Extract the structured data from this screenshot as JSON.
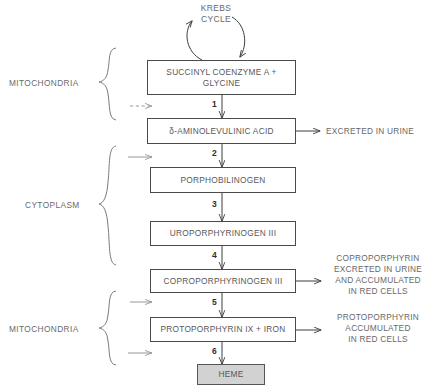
{
  "diagram": {
    "nodes": [
      {
        "id": "succinyl",
        "label": "SUCCINYL COENZYME A +\nGLYCINE"
      },
      {
        "id": "ala",
        "label": "δ-AMINOLEVULINIC ACID"
      },
      {
        "id": "pbg",
        "label": "PORPHOBILINOGEN"
      },
      {
        "id": "urogen",
        "label": "UROPORPHYRINOGEN III"
      },
      {
        "id": "coprogen",
        "label": "COPROPORPHYRINOGEN III"
      },
      {
        "id": "protoix",
        "label": "PROTOPORPHYRIN IX + IRON"
      },
      {
        "id": "heme",
        "label": "HEME"
      }
    ],
    "steps": [
      {
        "number": "1"
      },
      {
        "number": "2"
      },
      {
        "number": "3"
      },
      {
        "number": "4"
      },
      {
        "number": "5"
      },
      {
        "number": "6"
      }
    ],
    "compartments": [
      {
        "id": "mito-top",
        "label": "MITOCHONDRIA"
      },
      {
        "id": "cytoplasm",
        "label": "CYTOPLASM"
      },
      {
        "id": "mito-bottom",
        "label": "MITOCHONDRIA"
      }
    ],
    "cycle": {
      "label": "KREBS\nCYCLE"
    },
    "outputs": [
      {
        "id": "ala-out",
        "label": "EXCRETED IN URINE"
      },
      {
        "id": "coprogen-out",
        "label": "COPROPORPHYRIN\nEXCRETED IN URINE\nAND ACCUMULATED\nIN RED CELLS"
      },
      {
        "id": "protoix-out",
        "label": "PROTOPORPHYRIN\nACCUMULATED\nIN RED CELLS"
      }
    ],
    "colors": {
      "stroke": "#4a4a4a",
      "text": "#5f5f5f",
      "heme_fill": "#d2d2d2",
      "background": "#ffffff"
    }
  }
}
